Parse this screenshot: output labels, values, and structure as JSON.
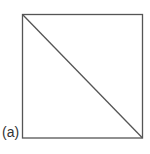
{
  "figure": {
    "label": "(a)",
    "shape": "square",
    "diagonal": "top-left to bottom-right",
    "stroke_color": "#555555",
    "square": {
      "x1": 22,
      "y1": 14,
      "x2": 142,
      "y2": 138
    }
  }
}
